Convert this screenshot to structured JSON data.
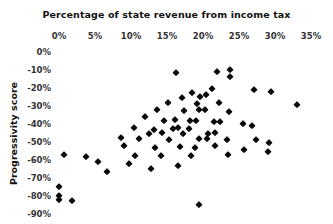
{
  "chart": {
    "title": "Percentage of state revenue from income tax",
    "yaxis_title": "Progressivity score"
  },
  "chart_data": {
    "type": "scatter",
    "title": "Percentage of state revenue from income tax",
    "xlabel": "Percentage of state revenue from income tax",
    "ylabel": "Progressivity score",
    "xlim": [
      0,
      35
    ],
    "ylim": [
      -90,
      0
    ],
    "xticks": [
      "0%",
      "5%",
      "10%",
      "15%",
      "20%",
      "25%",
      "30%",
      "35%"
    ],
    "xtick_values": [
      0,
      5,
      10,
      15,
      20,
      25,
      30,
      35
    ],
    "yticks": [
      "0%",
      "-10%",
      "-20%",
      "-30%",
      "-40%",
      "-50%",
      "-60%",
      "-70%",
      "-80%",
      "-90%"
    ],
    "ytick_values": [
      0,
      -10,
      -20,
      -30,
      -40,
      -50,
      -60,
      -70,
      -80,
      -90
    ],
    "grid": false,
    "legend": null,
    "marker": "diamond",
    "marker_color": "#0a0a0a",
    "points": [
      {
        "x": 16.2,
        "y": -11.7
      },
      {
        "x": 22.0,
        "y": -11.1
      },
      {
        "x": 23.8,
        "y": -10.0
      },
      {
        "x": 23.8,
        "y": -13.9
      },
      {
        "x": 21.3,
        "y": -20.6
      },
      {
        "x": 18.5,
        "y": -22.8
      },
      {
        "x": 19.6,
        "y": -25.0
      },
      {
        "x": 20.4,
        "y": -23.9
      },
      {
        "x": 27.1,
        "y": -21.1
      },
      {
        "x": 29.4,
        "y": -22.2
      },
      {
        "x": 33.0,
        "y": -29.4
      },
      {
        "x": 17.1,
        "y": -25.6
      },
      {
        "x": 15.1,
        "y": -28.3
      },
      {
        "x": 19.2,
        "y": -28.9
      },
      {
        "x": 22.2,
        "y": -28.3
      },
      {
        "x": 13.6,
        "y": -32.2
      },
      {
        "x": 17.4,
        "y": -32.8
      },
      {
        "x": 19.4,
        "y": -32.2
      },
      {
        "x": 20.3,
        "y": -32.2
      },
      {
        "x": 23.6,
        "y": -33.3
      },
      {
        "x": 11.9,
        "y": -36.1
      },
      {
        "x": 14.6,
        "y": -38.3
      },
      {
        "x": 16.1,
        "y": -37.8
      },
      {
        "x": 18.2,
        "y": -38.3
      },
      {
        "x": 19.0,
        "y": -38.3
      },
      {
        "x": 21.5,
        "y": -38.9
      },
      {
        "x": 22.4,
        "y": -38.9
      },
      {
        "x": 25.6,
        "y": -40.0
      },
      {
        "x": 26.8,
        "y": -41.1
      },
      {
        "x": 10.4,
        "y": -42.2
      },
      {
        "x": 13.2,
        "y": -43.3
      },
      {
        "x": 15.8,
        "y": -42.8
      },
      {
        "x": 16.5,
        "y": -42.2
      },
      {
        "x": 18.1,
        "y": -42.8
      },
      {
        "x": 12.5,
        "y": -45.6
      },
      {
        "x": 14.3,
        "y": -45.0
      },
      {
        "x": 17.2,
        "y": -45.6
      },
      {
        "x": 20.7,
        "y": -45.6
      },
      {
        "x": 21.7,
        "y": -45.0
      },
      {
        "x": 8.6,
        "y": -47.8
      },
      {
        "x": 11.1,
        "y": -48.3
      },
      {
        "x": 15.3,
        "y": -48.9
      },
      {
        "x": 19.4,
        "y": -48.3
      },
      {
        "x": 20.6,
        "y": -48.3
      },
      {
        "x": 23.4,
        "y": -48.9
      },
      {
        "x": 27.4,
        "y": -48.9
      },
      {
        "x": 29.2,
        "y": -50.6
      },
      {
        "x": 9.0,
        "y": -52.2
      },
      {
        "x": 13.3,
        "y": -53.3
      },
      {
        "x": 16.8,
        "y": -52.8
      },
      {
        "x": 18.9,
        "y": -53.3
      },
      {
        "x": 21.7,
        "y": -52.2
      },
      {
        "x": 25.7,
        "y": -54.4
      },
      {
        "x": 0.7,
        "y": -57.2
      },
      {
        "x": 3.8,
        "y": -58.3
      },
      {
        "x": 10.6,
        "y": -57.8
      },
      {
        "x": 14.2,
        "y": -57.8
      },
      {
        "x": 18.3,
        "y": -57.8
      },
      {
        "x": 23.5,
        "y": -57.2
      },
      {
        "x": 29.0,
        "y": -55.6
      },
      {
        "x": 5.4,
        "y": -61.1
      },
      {
        "x": 9.7,
        "y": -62.2
      },
      {
        "x": 16.5,
        "y": -63.3
      },
      {
        "x": 6.7,
        "y": -66.7
      },
      {
        "x": 12.8,
        "y": -65.0
      },
      {
        "x": 0.0,
        "y": -75.0
      },
      {
        "x": 0.0,
        "y": -80.0
      },
      {
        "x": 0.0,
        "y": -82.2
      },
      {
        "x": 1.8,
        "y": -82.8
      },
      {
        "x": 19.4,
        "y": -85.0
      }
    ]
  }
}
